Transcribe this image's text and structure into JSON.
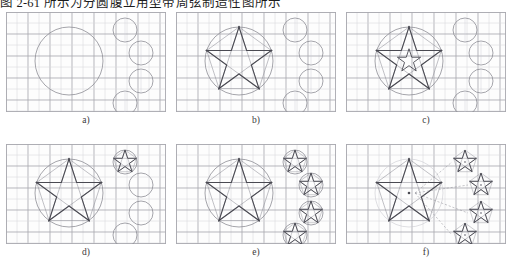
{
  "caption_top": "图 2-61 所示为分圆腹立用型带周弦制造性图所示",
  "figure": {
    "kind": "construction-sequence",
    "panel_count": 6,
    "rows": 2,
    "cols": 3,
    "panels": [
      {
        "id": "a",
        "label": "a)",
        "description": "Grid with one large circle at left and four small circles staggered at right",
        "shows_big_circle": true,
        "shows_big_star": false,
        "shows_inner_small_star": false,
        "small_circles": 4,
        "small_stars": 0,
        "shows_construction_lines": false,
        "shows_center_marks": false,
        "shows_circles": true
      },
      {
        "id": "b",
        "label": "b)",
        "description": "Large five-pointed star inscribed in the big circle with construction chords; four empty small circles",
        "shows_big_circle": true,
        "shows_big_star": true,
        "shows_inner_small_star": false,
        "small_circles": 4,
        "small_stars": 0,
        "shows_construction_lines": true,
        "shows_center_marks": false,
        "shows_circles": true
      },
      {
        "id": "c",
        "label": "c)",
        "description": "Big star with a reduced star nested inside it; four empty small circles",
        "shows_big_circle": true,
        "shows_big_star": true,
        "shows_inner_small_star": true,
        "small_circles": 4,
        "small_stars": 0,
        "shows_construction_lines": true,
        "shows_center_marks": false,
        "shows_circles": true
      },
      {
        "id": "d",
        "label": "d)",
        "description": "Big star finished; the lowest small circle now contains a small star, three circles still empty",
        "shows_big_circle": true,
        "shows_big_star": true,
        "shows_inner_small_star": false,
        "small_circles": 4,
        "small_stars": 1,
        "shows_construction_lines": true,
        "shows_center_marks": false,
        "shows_circles": true
      },
      {
        "id": "e",
        "label": "e)",
        "description": "All four small circles contain small five-pointed stars",
        "shows_big_circle": true,
        "shows_big_star": true,
        "shows_inner_small_star": false,
        "small_circles": 4,
        "small_stars": 4,
        "shows_construction_lines": true,
        "shows_center_marks": false,
        "shows_circles": true
      },
      {
        "id": "f",
        "label": "f)",
        "description": "Final layout: stars kept, guide circles faded out, dashed centre marks and alignment ticks shown",
        "shows_big_circle": true,
        "shows_big_star": true,
        "shows_inner_small_star": false,
        "small_circles": 4,
        "small_stars": 4,
        "shows_construction_lines": true,
        "shows_center_marks": true,
        "shows_circles": false
      }
    ],
    "grid": {
      "cell_px": 11,
      "cols": 14,
      "rows": 8,
      "minor_color": "#d8d8dc",
      "major_color": "#a9a9b0",
      "major_every": 2
    },
    "geometry": {
      "big_circle": {
        "cx": 63,
        "cy": 49,
        "r": 34
      },
      "small_circles": [
        {
          "cx": 119,
          "cy": 18,
          "r": 12
        },
        {
          "cx": 135,
          "cy": 41,
          "r": 12
        },
        {
          "cx": 135,
          "cy": 69,
          "r": 12
        },
        {
          "cx": 119,
          "cy": 91,
          "r": 12
        }
      ],
      "panel_w": 160,
      "panel_h": 100
    },
    "colors": {
      "ink": "#4a4a52",
      "ink_light": "#8e8e96",
      "page": "#ffffff",
      "panel_bg": "#fdfdfd"
    }
  }
}
